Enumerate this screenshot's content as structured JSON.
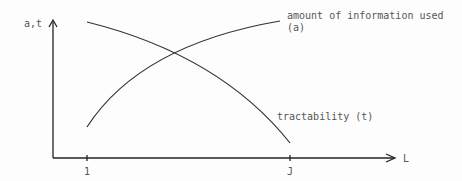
{
  "diagram": {
    "y_axis_label": "a,t",
    "x_axis_label": "L",
    "x_ticks": [
      "1",
      "J"
    ],
    "curves": [
      {
        "name": "information",
        "label_line1": "amount of information used",
        "label_line2": "(a)",
        "trend": "increasing"
      },
      {
        "name": "tractability",
        "label_line1": "tractability (t)",
        "trend": "decreasing"
      }
    ],
    "colors": {
      "line": "#333333",
      "text": "#555555",
      "background": "#fdfdfd"
    }
  }
}
